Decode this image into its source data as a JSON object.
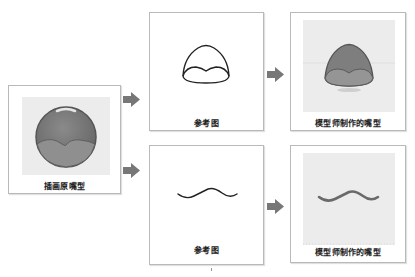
{
  "left_panel": {
    "label": "插画原嘴型",
    "description": "illustrated round mouth with lower lip curve"
  },
  "top_row": {
    "reference": {
      "label": "参考图",
      "description": "outline of open mouth shape"
    },
    "result": {
      "label": "模型师制作的嘴型",
      "description": "modeled open mouth shape"
    }
  },
  "bottom_row": {
    "reference": {
      "label": "参考图",
      "description": "wavy line closed mouth"
    },
    "result": {
      "label": "模型师制作的嘴型",
      "description": "modeled wavy closed mouth"
    }
  },
  "colors": {
    "mouth_fill": "#7c7c7c",
    "mouth_lip": "#8e8e8e",
    "arrow": "#777777",
    "panel_border": "#b9b9b9",
    "inner_bg": "#ececec"
  },
  "arrows": [
    "arrow-icon",
    "arrow-icon",
    "arrow-icon",
    "arrow-icon"
  ]
}
